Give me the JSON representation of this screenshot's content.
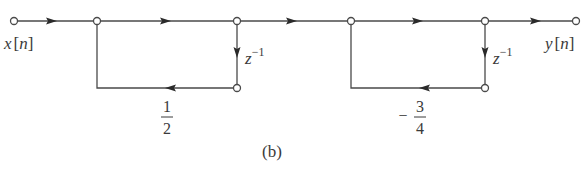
{
  "diagram": {
    "type": "signal-flow-graph",
    "caption": "(b)",
    "input_label": {
      "var": "x",
      "open": "[",
      "idx": "n",
      "close": "]"
    },
    "output_label": {
      "var": "y",
      "open": "[",
      "idx": "n",
      "close": "]"
    },
    "delay_1": {
      "base": "z",
      "exp": "−1"
    },
    "delay_2": {
      "base": "z",
      "exp": "−1"
    },
    "gain_1": {
      "sign": "",
      "num": "1",
      "den": "2"
    },
    "gain_2": {
      "sign": "−",
      "num": "3",
      "den": "4"
    },
    "nodes": [
      {
        "id": "input",
        "x": 14,
        "y": 21
      },
      {
        "id": "n1",
        "x": 97,
        "y": 21
      },
      {
        "id": "n2",
        "x": 237,
        "y": 21
      },
      {
        "id": "n3",
        "x": 351,
        "y": 21
      },
      {
        "id": "n4",
        "x": 485,
        "y": 21
      },
      {
        "id": "output",
        "x": 576,
        "y": 21
      },
      {
        "id": "d1",
        "x": 237,
        "y": 88
      },
      {
        "id": "d2",
        "x": 485,
        "y": 88
      }
    ],
    "branches": [
      {
        "from": "input",
        "to": "n1",
        "gain": "1"
      },
      {
        "from": "n1",
        "to": "n2",
        "gain": "1"
      },
      {
        "from": "n2",
        "to": "d1",
        "gain": "z^-1"
      },
      {
        "from": "d1",
        "to": "n1",
        "gain": "1/2"
      },
      {
        "from": "n2",
        "to": "n3",
        "gain": "1"
      },
      {
        "from": "n3",
        "to": "n4",
        "gain": "1"
      },
      {
        "from": "n4",
        "to": "d2",
        "gain": "z^-1"
      },
      {
        "from": "d2",
        "to": "n3",
        "gain": "-3/4"
      },
      {
        "from": "n4",
        "to": "output",
        "gain": "1"
      }
    ]
  }
}
